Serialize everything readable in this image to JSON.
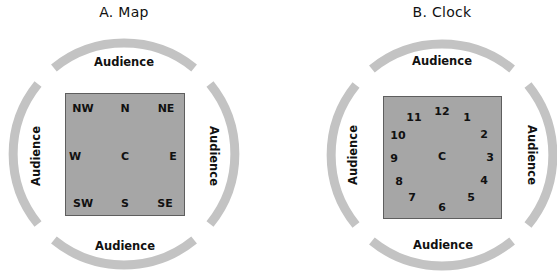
{
  "colors": {
    "arc": "#c3c3c3",
    "stage": "#a6a6a6",
    "stage_border": "#5e5e5e",
    "text": "#111111"
  },
  "panels": [
    {
      "title": "A.  Map",
      "audience": {
        "top": "Audience",
        "bottom": "Audience",
        "left": "Audience",
        "right": "Audience"
      },
      "labels": [
        "NW",
        "N",
        "NE",
        "W",
        "C",
        "E",
        "SW",
        "S",
        "SE"
      ]
    },
    {
      "title": "B.  Clock",
      "audience": {
        "top": "Audience",
        "bottom": "Audience",
        "left": "Audience",
        "right": "Audience"
      },
      "labels": [
        "12",
        "1",
        "2",
        "3",
        "4",
        "5",
        "6",
        "7",
        "8",
        "9",
        "10",
        "11",
        "C"
      ]
    }
  ]
}
